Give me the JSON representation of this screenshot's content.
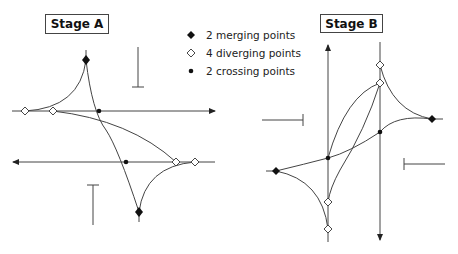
{
  "stage_a": {
    "title": "Stage A"
  },
  "stage_b": {
    "title": "Stage B"
  },
  "legend": {
    "items": [
      {
        "symbol": "filled-diamond",
        "label": "2 merging points"
      },
      {
        "symbol": "hollow-diamond",
        "label": "4 diverging points"
      },
      {
        "symbol": "filled-dot",
        "label": "2 crossing points"
      }
    ]
  },
  "colors": {
    "line": "#444444",
    "stroke": "#222222",
    "background": "#ffffff"
  }
}
